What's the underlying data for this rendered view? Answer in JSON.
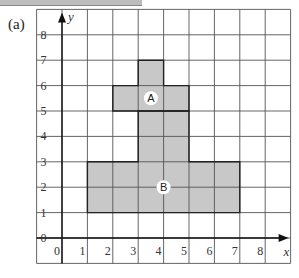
{
  "part_label": "(a)",
  "axes": {
    "x_label": "x",
    "y_label": "y",
    "x_ticks": [
      "0",
      "1",
      "2",
      "3",
      "4",
      "5",
      "6",
      "7",
      "8"
    ],
    "y_ticks": [
      "0",
      "1",
      "2",
      "3",
      "4",
      "5",
      "6",
      "7",
      "8"
    ],
    "x_range": [
      -1,
      9
    ],
    "y_range": [
      -1,
      9
    ]
  },
  "shapes": [
    {
      "label": "A",
      "vertices": [
        [
          2,
          5
        ],
        [
          5,
          5
        ],
        [
          5,
          6
        ],
        [
          4,
          6
        ],
        [
          4,
          7
        ],
        [
          3,
          7
        ],
        [
          3,
          6
        ],
        [
          2,
          6
        ]
      ]
    },
    {
      "label": "B",
      "vertices": [
        [
          1,
          1
        ],
        [
          7,
          1
        ],
        [
          7,
          3
        ],
        [
          5,
          3
        ],
        [
          5,
          5
        ],
        [
          3,
          5
        ],
        [
          3,
          3
        ],
        [
          1,
          3
        ]
      ]
    }
  ],
  "colors": {
    "shape_fill": "#c8c8c8",
    "grid": "#555555",
    "outline": "#222222"
  }
}
